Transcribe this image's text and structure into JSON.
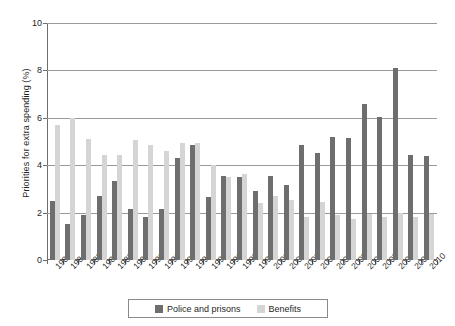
{
  "chart_data": {
    "type": "bar",
    "title": "",
    "subtitle": "",
    "xlabel": "",
    "ylabel": "Priorities for extra spending (%)",
    "ylim": [
      0,
      10
    ],
    "yticks": [
      0,
      2,
      4,
      6,
      8,
      10
    ],
    "ytick_labels": [
      "0",
      "2",
      "4",
      "6",
      "8",
      "10"
    ],
    "grid": true,
    "legend_position": "bottom",
    "categories": [
      "1983",
      "1984",
      "1985",
      "1986",
      "1987",
      "1989",
      "1990",
      "1991",
      "1993",
      "1994",
      "1995",
      "1996",
      "1997",
      "1999",
      "2000",
      "2001",
      "2002",
      "2003",
      "2004",
      "2005",
      "2006",
      "2007",
      "2008",
      "2009",
      "2010"
    ],
    "series": [
      {
        "name": "Police and prisons",
        "color": "#6e6e6e",
        "values": [
          2.5,
          1.5,
          1.9,
          2.7,
          3.35,
          2.15,
          1.8,
          2.15,
          4.3,
          4.85,
          2.65,
          3.55,
          3.5,
          2.9,
          3.55,
          3.15,
          4.85,
          4.5,
          5.2,
          5.15,
          6.6,
          6.05,
          8.1,
          4.45,
          4.4
        ]
      },
      {
        "name": "Benefits",
        "color": "#d5d5d5",
        "values": [
          5.7,
          6.0,
          5.1,
          4.45,
          4.45,
          5.05,
          4.85,
          4.6,
          4.95,
          4.95,
          4.0,
          3.5,
          3.65,
          2.4,
          2.7,
          2.55,
          1.8,
          2.45,
          1.9,
          1.75,
          1.95,
          1.8,
          2.0,
          1.8,
          1.95
        ]
      }
    ]
  },
  "legend": {
    "entries": [
      {
        "label": "Police and prisons",
        "color": "#6e6e6e"
      },
      {
        "label": "Benefits",
        "color": "#d5d5d5"
      }
    ]
  }
}
